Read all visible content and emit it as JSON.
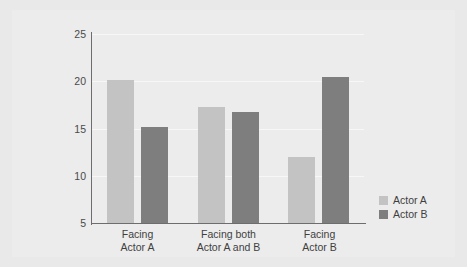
{
  "chart_data": {
    "type": "bar",
    "title": "",
    "xlabel": "",
    "ylabel": "Ratings of actors' causal role",
    "ylim": [
      5,
      25
    ],
    "yticks": [
      25,
      20,
      15,
      10,
      5
    ],
    "grid": true,
    "legend_position": "right",
    "categories": [
      "Facing\nActor A",
      "Facing both\nActor A and B",
      "Facing\nActor B"
    ],
    "series": [
      {
        "name": "Actor A",
        "color": "#c3c3c3",
        "values": [
          20.1,
          17.3,
          12.0
        ]
      },
      {
        "name": "Actor B",
        "color": "#7e7e7e",
        "values": [
          15.2,
          16.7,
          20.5
        ]
      }
    ]
  },
  "axis": {
    "tick_25": "25",
    "tick_20": "20",
    "tick_15": "15",
    "tick_10": "10",
    "tick_5": "5"
  },
  "categories": {
    "c0": "Facing\nActor A",
    "c1": "Facing both\nActor A and B",
    "c2": "Facing\nActor B"
  },
  "legend": {
    "a": "Actor A",
    "b": "Actor B"
  },
  "colors": {
    "actor_a": "#c3c3c3",
    "actor_b": "#7e7e7e",
    "axis": "#6d6d6d",
    "panel": "#ececec",
    "frame": "#e9e9e9",
    "grid": "#f7f7f7"
  }
}
